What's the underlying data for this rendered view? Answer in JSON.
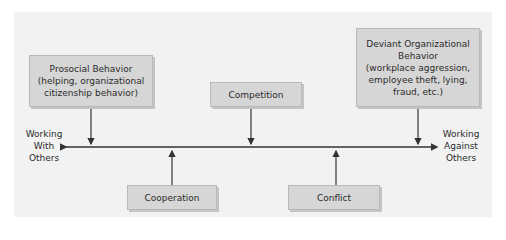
{
  "diagram": {
    "axis": {
      "left_label": [
        "Working",
        "With",
        "Others"
      ],
      "right_label": [
        "Working",
        "Against",
        "Others"
      ]
    },
    "top_boxes": [
      {
        "id": "prosocial",
        "lines": [
          "Prosocial Behavior",
          "(helping, organizational",
          "citizenship behavior)"
        ]
      },
      {
        "id": "competition",
        "lines": [
          "Competition"
        ]
      },
      {
        "id": "deviant",
        "lines": [
          "Deviant Organizational",
          "Behavior",
          "(workplace aggression,",
          "employee theft, lying,",
          "fraud, etc.)"
        ]
      }
    ],
    "bottom_boxes": [
      {
        "id": "cooperation",
        "lines": [
          "Cooperation"
        ]
      },
      {
        "id": "conflict",
        "lines": [
          "Conflict"
        ]
      }
    ],
    "colors": {
      "panel": "#f2f2f2",
      "box_fill": "#d6d6d6",
      "line": "#333333"
    }
  }
}
